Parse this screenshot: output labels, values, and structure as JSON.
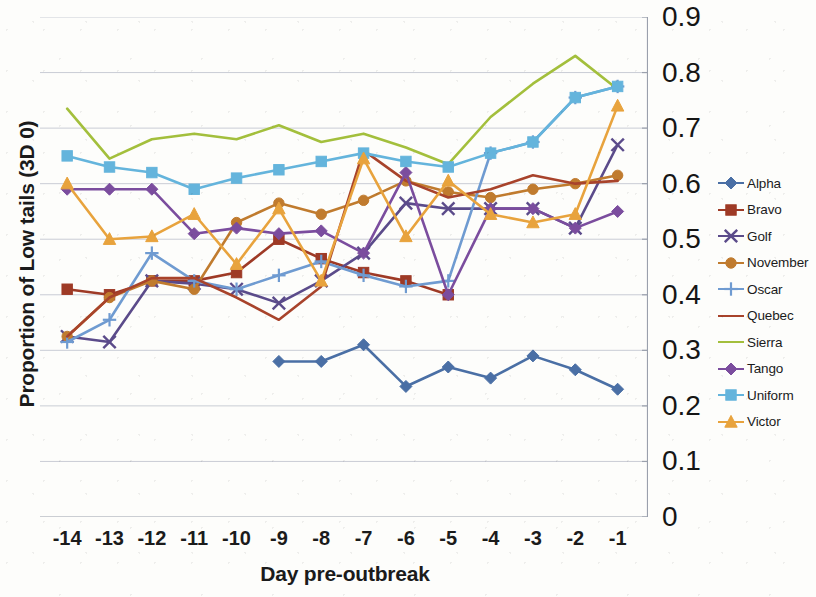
{
  "chart_data": {
    "type": "line",
    "title": "",
    "xlabel": "Day pre-outbreak",
    "ylabel": "Proportion of Low tails (3D 0)",
    "x": [
      -14,
      -13,
      -12,
      -11,
      -10,
      -9,
      -8,
      -7,
      -6,
      -5,
      -4,
      -3,
      -2,
      -1
    ],
    "x_tick_labels": [
      "-14",
      "-13",
      "-12",
      "-11",
      "-10",
      "-9",
      "-8",
      "-7",
      "-6",
      "-5",
      "-4",
      "-3",
      "-2",
      "-1"
    ],
    "y_tick_labels": [
      "0.9",
      "0.8",
      "0.7",
      "0.6",
      "0.5",
      "0.4",
      "0.3",
      "0.2",
      "0.1",
      "0"
    ],
    "y_ticks": [
      0.9,
      0.8,
      0.7,
      0.6,
      0.5,
      0.4,
      0.3,
      0.2,
      0.1,
      0
    ],
    "ylim": [
      0,
      0.9
    ],
    "y_axis_position": "right",
    "grid": "horizontal",
    "legend_position": "right",
    "series": [
      {
        "name": "Alpha",
        "color": "#4a6fa5",
        "marker": "diamond",
        "values": [
          null,
          null,
          null,
          null,
          null,
          0.28,
          0.28,
          0.31,
          0.235,
          0.27,
          0.25,
          0.29,
          0.265,
          0.23
        ]
      },
      {
        "name": "Bravo",
        "color": "#9e3a26",
        "marker": "square",
        "values": [
          0.41,
          0.4,
          0.425,
          0.425,
          0.44,
          0.5,
          0.465,
          0.44,
          0.425,
          0.4,
          null,
          null,
          null,
          null
        ]
      },
      {
        "name": "Golf",
        "color": "#5b4b8a",
        "marker": "cross",
        "values": [
          0.325,
          0.315,
          0.425,
          0.42,
          0.41,
          0.385,
          0.425,
          0.475,
          0.565,
          0.555,
          0.555,
          0.555,
          0.52,
          0.67
        ]
      },
      {
        "name": "November",
        "color": "#c07b2e",
        "marker": "circle",
        "values": [
          0.325,
          0.395,
          0.425,
          0.41,
          0.53,
          0.565,
          0.545,
          0.57,
          0.605,
          0.585,
          0.575,
          0.59,
          0.6,
          0.615
        ]
      },
      {
        "name": "Oscar",
        "color": "#6f9bd1",
        "marker": "plus",
        "values": [
          0.315,
          0.355,
          0.475,
          0.425,
          0.41,
          0.435,
          0.46,
          0.435,
          0.415,
          0.425,
          0.655,
          0.675,
          0.755,
          0.775
        ]
      },
      {
        "name": "Quebec",
        "color": "#a8432b",
        "marker": "line",
        "values": [
          0.325,
          0.395,
          0.43,
          0.43,
          0.395,
          0.355,
          0.415,
          0.66,
          0.605,
          0.575,
          0.59,
          0.615,
          0.6,
          0.605
        ]
      },
      {
        "name": "Sierra",
        "color": "#a3bf3c",
        "marker": "line",
        "values": [
          0.735,
          0.645,
          0.68,
          0.69,
          0.68,
          0.705,
          0.675,
          0.69,
          0.665,
          0.635,
          0.72,
          0.78,
          0.83,
          0.77
        ]
      },
      {
        "name": "Tango",
        "color": "#7b4d9e",
        "marker": "diamond",
        "values": [
          0.59,
          0.59,
          0.59,
          0.51,
          0.52,
          0.51,
          0.515,
          0.475,
          0.62,
          0.4,
          0.555,
          0.555,
          0.52,
          0.55
        ]
      },
      {
        "name": "Uniform",
        "color": "#64b4dc",
        "marker": "square",
        "values": [
          0.65,
          0.63,
          0.62,
          0.59,
          0.61,
          0.625,
          0.64,
          0.655,
          0.64,
          0.63,
          0.655,
          0.675,
          0.755,
          0.775
        ]
      },
      {
        "name": "Victor",
        "color": "#e8a33d",
        "marker": "triangle",
        "values": [
          0.6,
          0.5,
          0.505,
          0.545,
          0.455,
          0.555,
          0.425,
          0.645,
          0.505,
          0.605,
          0.545,
          0.53,
          0.545,
          0.74
        ]
      }
    ]
  },
  "axes": {
    "y_title": "Proportion of Low tails (3D 0)",
    "x_title": "Day pre-outbreak"
  }
}
